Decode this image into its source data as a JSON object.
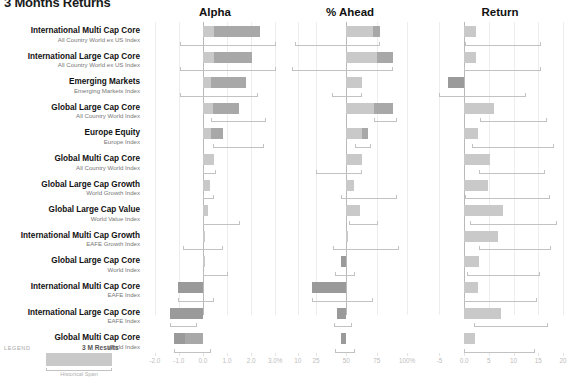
{
  "header": {
    "title": "3 Months Returns",
    "legend_label": "LEGEND",
    "legend_result": "3 M Results",
    "legend_span": "Historical Span"
  },
  "chart_data": {
    "type": "bar",
    "title": "3 Months Returns",
    "orientation": "horizontal",
    "grid": true,
    "legend_position": "bottom-left",
    "categories": [
      "International Multi Cap Core",
      "International Large Cap Core",
      "Emerging Markets",
      "Global Large Cap Core",
      "Europe Equity",
      "Global Multi Cap Core",
      "Global Large Cap Growth",
      "Global Large Cap Value",
      "International Multi Cap Growth",
      "Global Large Cap Core",
      "International Multi Cap Core",
      "International Large Cap Core",
      "Global Multi Cap Core"
    ],
    "benchmarks": [
      "All Country World ex US Index",
      "All Country World ex US Index",
      "Emerging Markets Index",
      "All Country World Index",
      "Europe Index",
      "All Country World Index",
      "World Growth Index",
      "World Value Index",
      "EAFE Growth Index",
      "World Index",
      "EAFE Index",
      "EAFE Index",
      "World Index"
    ],
    "rows": [
      {
        "category": "International Multi Cap Core",
        "benchmark": "All Country World ex US Index",
        "alpha": 2.35,
        "alpha_mid": 0.45,
        "alpha_span": [
          -0.95,
          3.05
        ],
        "ahead": 78,
        "ahead_mid": 72,
        "ahead_span": [
          8,
          78
        ],
        "return": 2.4,
        "return_span": [
          0.2,
          15.6
        ]
      },
      {
        "category": "International Large Cap Core",
        "benchmark": "All Country World ex US Index",
        "alpha": 2.05,
        "alpha_mid": 0.45,
        "alpha_span": [
          -0.95,
          3.05
        ],
        "ahead": 88,
        "ahead_mid": 75,
        "ahead_span": [
          5,
          88
        ],
        "return": 2.3,
        "return_span": [
          0.0,
          15.6
        ]
      },
      {
        "category": "Emerging Markets",
        "benchmark": "Emerging Markets Index",
        "alpha": 1.8,
        "alpha_mid": 0.35,
        "alpha_span": [
          -0.95,
          2.3
        ],
        "ahead": 63,
        "ahead_mid": 63,
        "ahead_span": [
          38,
          63
        ],
        "return": -3.2,
        "return_span": [
          -5.0,
          12.6
        ]
      },
      {
        "category": "Global Large Cap Core",
        "benchmark": "All Country World Index",
        "alpha": 1.5,
        "alpha_mid": 0.4,
        "alpha_span": [
          0.35,
          2.6
        ],
        "ahead": 88,
        "ahead_mid": 73,
        "ahead_span": [
          73,
          92
        ],
        "return": 6.1,
        "return_span": [
          3.2,
          16.8
        ]
      },
      {
        "category": "Europe Equity",
        "benchmark": "Europe Index",
        "alpha": 0.85,
        "alpha_mid": 0.35,
        "alpha_span": [
          0.4,
          2.55
        ],
        "ahead": 68,
        "ahead_mid": 63,
        "ahead_span": [
          57,
          70
        ],
        "return": 2.9,
        "return_span": [
          1.6,
          18.2
        ]
      },
      {
        "category": "Global Multi Cap Core",
        "benchmark": "All Country World Index",
        "alpha": 0.45,
        "alpha_mid": 0.45,
        "alpha_span": [
          0.0,
          0.55
        ],
        "ahead": 63,
        "ahead_mid": 63,
        "ahead_span": [
          25,
          63
        ],
        "return": 5.2,
        "return_span": [
          3.0,
          16.4
        ]
      },
      {
        "category": "Global Large Cap Growth",
        "benchmark": "World Growth Index",
        "alpha": 0.3,
        "alpha_mid": 0.3,
        "alpha_span": [
          0.0,
          0.45
        ],
        "ahead": 56,
        "ahead_mid": 56,
        "ahead_span": [
          46,
          92
        ],
        "return": 4.9,
        "return_span": [
          0.2,
          17.4
        ]
      },
      {
        "category": "Global Large Cap Value",
        "benchmark": "World Value Index",
        "alpha": 0.2,
        "alpha_mid": 0.2,
        "alpha_span": [
          0.0,
          1.55
        ],
        "ahead": 61,
        "ahead_mid": 61,
        "ahead_span": [
          52,
          76
        ],
        "return": 7.9,
        "return_span": [
          1.2,
          18.8
        ]
      },
      {
        "category": "International Multi Cap Growth",
        "benchmark": "EAFE Growth Index",
        "alpha": 0.1,
        "alpha_mid": 0.1,
        "alpha_span": [
          -0.85,
          0.85
        ],
        "ahead": 51,
        "ahead_mid": 51,
        "ahead_span": [
          39,
          93
        ],
        "return": 6.8,
        "return_span": [
          3.0,
          17.6
        ]
      },
      {
        "category": "Global Large Cap Core",
        "benchmark": "World Index",
        "alpha": 0.08,
        "alpha_mid": 0.08,
        "alpha_span": [
          0.0,
          1.05
        ],
        "ahead": 46,
        "ahead_mid": 46,
        "ahead_span": [
          41,
          57
        ],
        "return": 3.1,
        "return_span": [
          0.6,
          15.4
        ]
      },
      {
        "category": "International Multi Cap Core",
        "benchmark": "EAFE Index",
        "alpha": -1.05,
        "alpha_mid": -1.05,
        "alpha_span": [
          -1.05,
          0.45
        ],
        "ahead": 22,
        "ahead_mid": 22,
        "ahead_span": [
          22,
          72
        ],
        "return": 2.8,
        "return_span": [
          0.0,
          14.8
        ]
      },
      {
        "category": "International Large Cap Core",
        "benchmark": "EAFE Index",
        "alpha": -1.35,
        "alpha_mid": -1.35,
        "alpha_span": [
          -1.35,
          -0.25
        ],
        "ahead": 42,
        "ahead_mid": 42,
        "ahead_span": [
          40,
          55
        ],
        "return": 7.4,
        "return_span": [
          2.0,
          17.0
        ]
      },
      {
        "category": "Global Multi Cap Core",
        "benchmark": "World Index",
        "alpha": -1.2,
        "alpha_mid": -0.75,
        "alpha_span": [
          -1.2,
          0.35
        ],
        "ahead": 46,
        "ahead_mid": 46,
        "ahead_span": [
          41,
          57
        ],
        "return": 2.2,
        "return_span": [
          0.0,
          14.4
        ]
      }
    ],
    "panels": [
      {
        "key": "alpha",
        "label": "Alpha",
        "ticks": [
          "-2.0",
          "-1.0",
          "0.0",
          "1.0",
          "2.0",
          "3.0%"
        ],
        "tick_values": [
          -2,
          -1,
          0,
          1,
          2,
          3
        ],
        "lim": [
          -2.2,
          3.2
        ],
        "zero": 0
      },
      {
        "key": "ahead",
        "label": "% Ahead",
        "ticks": [
          "10",
          "25",
          "50",
          "75",
          "100%"
        ],
        "tick_values": [
          10,
          25,
          50,
          75,
          100
        ],
        "lim": [
          2,
          104
        ],
        "zero": 50
      },
      {
        "key": "return",
        "label": "Return",
        "ticks": [
          "-5",
          "0.0",
          "5",
          "10",
          "15",
          "20"
        ],
        "tick_values": [
          -5,
          0,
          5,
          10,
          15,
          20
        ],
        "lim": [
          -6.5,
          21
        ],
        "zero": 0
      }
    ]
  }
}
